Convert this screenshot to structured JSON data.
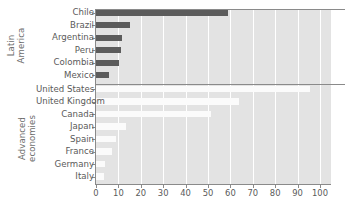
{
  "chart_data": {
    "type": "bar",
    "orientation": "horizontal",
    "title": "",
    "xlabel": "",
    "ylabel": "",
    "xlim": [
      0,
      100
    ],
    "xticks": [
      0,
      10,
      20,
      30,
      40,
      50,
      60,
      70,
      80,
      90,
      100
    ],
    "grid": true,
    "legend": "none",
    "groups": [
      {
        "name": "Latin\nAmerica",
        "color": "#5c5c5c",
        "categories": [
          "Chile",
          "Brazil",
          "Argentina",
          "Peru",
          "Colombia",
          "Mexico"
        ],
        "values": [
          59,
          15,
          11.5,
          11,
          10.3,
          6
        ]
      },
      {
        "name": "Advanced\neconomies",
        "color": "#fbfbfb",
        "categories": [
          "United States",
          "United Kingdom",
          "Canada",
          "Japan",
          "Spain",
          "France",
          "Germany",
          "Italy"
        ],
        "values": [
          95.5,
          64,
          51.5,
          13.5,
          9,
          7,
          4,
          3.5
        ]
      }
    ],
    "categories": [
      "Chile",
      "Brazil",
      "Argentina",
      "Peru",
      "Colombia",
      "Mexico",
      "United States",
      "United Kingdom",
      "Canada",
      "Japan",
      "Spain",
      "France",
      "Germany",
      "Italy"
    ],
    "values": [
      59,
      15,
      11.5,
      11,
      10.3,
      6,
      95.5,
      64,
      51.5,
      13.5,
      9,
      7,
      4,
      3.5
    ],
    "colors": {
      "latin_america_bars": "#5c5c5c",
      "advanced_economies_bars": "#fbfbfb",
      "plot_background": "#e3e3e3",
      "gridlines": "#ffffff",
      "axis": "#8a8a8a",
      "text": "#5a5a5a"
    }
  }
}
